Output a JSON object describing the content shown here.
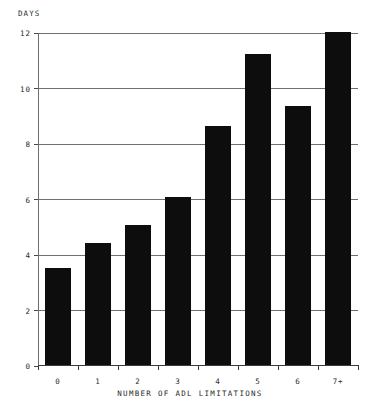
{
  "chart_data": {
    "type": "bar",
    "title": "",
    "subtitle": "",
    "xlabel": "NUMBER OF ADL LIMITATIONS",
    "ylabel": "DAYS",
    "categories": [
      "0",
      "1",
      "2",
      "3",
      "4",
      "5",
      "6",
      "7+"
    ],
    "values": [
      3.5,
      4.4,
      5.05,
      6.05,
      8.6,
      11.2,
      9.35,
      12.0
    ],
    "series": [
      {
        "name": "DAYS",
        "values": [
          3.5,
          4.4,
          5.05,
          6.05,
          8.6,
          11.2,
          9.35,
          12.0
        ]
      }
    ],
    "ylim": [
      0,
      12
    ],
    "xlim": [
      0,
      8
    ],
    "yticks": [
      0,
      2,
      4,
      6,
      8,
      10,
      12
    ],
    "ytick_labels": [
      "0",
      "2",
      "4",
      "6",
      "8",
      "10",
      "12"
    ],
    "gridlines": [
      2,
      4,
      6,
      8,
      10,
      12
    ],
    "grid": true,
    "grid_axis": "y",
    "legend": false,
    "legend_position": "none",
    "bar_color": "#0d0d0d",
    "grid_color": "#6f6f6f",
    "axis_color": "#3a3a3a",
    "background_color": "#ffffff",
    "text_color": "#2b2b2b",
    "bar_width_fraction": 0.66,
    "annotations": []
  }
}
